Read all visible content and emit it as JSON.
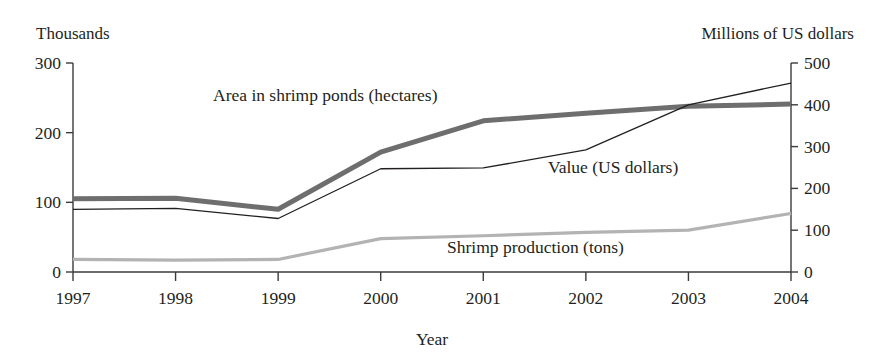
{
  "chart_data": {
    "type": "line",
    "title": "",
    "xlabel": "Year",
    "left_axis_label": "Thousands",
    "right_axis_label": "Millions of US dollars",
    "categories": [
      "1997",
      "1998",
      "1999",
      "2000",
      "2001",
      "2002",
      "2003",
      "2004"
    ],
    "left_ticks": [
      "0",
      "100",
      "200",
      "300"
    ],
    "right_ticks": [
      "0",
      "100",
      "200",
      "300",
      "400",
      "500"
    ],
    "ylim_left": [
      0,
      300
    ],
    "ylim_right": [
      0,
      500
    ],
    "grid": false,
    "legend_position": "inline-annotations",
    "series": [
      {
        "name": "Area in shrimp ponds (hectares)",
        "axis": "left",
        "unit": "thousands of hectares",
        "color": "#6e6e6e",
        "stroke_width": 5,
        "values": [
          105,
          106,
          90,
          172,
          217,
          228,
          238,
          241
        ]
      },
      {
        "name": "Value (US dollars)",
        "axis": "right",
        "unit": "millions of US dollars",
        "color": "#231f20",
        "stroke_width": 1.3,
        "values": [
          150,
          152,
          128,
          247,
          249,
          292,
          400,
          452
        ]
      },
      {
        "name": "Shrimp production (tons)",
        "axis": "left",
        "unit": "thousands of tons",
        "color": "#b3b3b3",
        "stroke_width": 3.2,
        "values": [
          18,
          17,
          18,
          48,
          52,
          57,
          60,
          84
        ]
      }
    ],
    "annotations": [
      {
        "text": "Area in shrimp ponds (hectares)",
        "x": 213,
        "y": 101
      },
      {
        "text": "Value (US dollars)",
        "x": 548,
        "y": 173
      },
      {
        "text": "Shrimp production (tons)",
        "x": 447,
        "y": 253
      }
    ]
  }
}
